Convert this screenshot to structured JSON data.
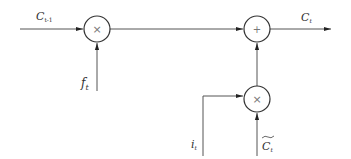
{
  "diagram": {
    "type": "lstm-cell-state-update",
    "nodes": [
      {
        "id": "mult-forget",
        "symbol": "×"
      },
      {
        "id": "add-cell",
        "symbol": "+"
      },
      {
        "id": "mult-input",
        "symbol": "×"
      }
    ],
    "labels": {
      "prev_cell": {
        "base": "C",
        "sub": "t-1"
      },
      "forget_gate": {
        "base": "f",
        "sub": "t"
      },
      "cell_out": {
        "base": "C",
        "sub": "t"
      },
      "input_gate": {
        "base": "i",
        "sub": "t"
      },
      "candidate": {
        "base": "C",
        "sub": "t",
        "accent": "~"
      }
    },
    "edges": [
      {
        "from": "prev_cell",
        "to": "mult-forget"
      },
      {
        "from": "forget_gate",
        "to": "mult-forget"
      },
      {
        "from": "mult-forget",
        "to": "add-cell"
      },
      {
        "from": "add-cell",
        "to": "cell_out"
      },
      {
        "from": "input_gate",
        "to": "mult-input"
      },
      {
        "from": "candidate",
        "to": "mult-input"
      },
      {
        "from": "mult-input",
        "to": "add-cell"
      }
    ],
    "colors": {
      "line": "#555555",
      "text": "#333333",
      "op": "#777777"
    }
  }
}
